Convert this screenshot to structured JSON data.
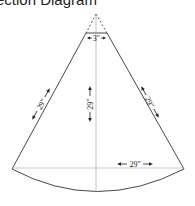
{
  "title": "Section Diagram",
  "diagram": {
    "shape": "circular-sector-panel",
    "labels": {
      "top_width": "3\"",
      "left_side": "29\"",
      "center_height": "29\"",
      "right_side": "29\"",
      "bottom_radius": "29\""
    },
    "colors": {
      "stroke": "#333333",
      "guide": "#999999",
      "background": "#ffffff"
    }
  }
}
